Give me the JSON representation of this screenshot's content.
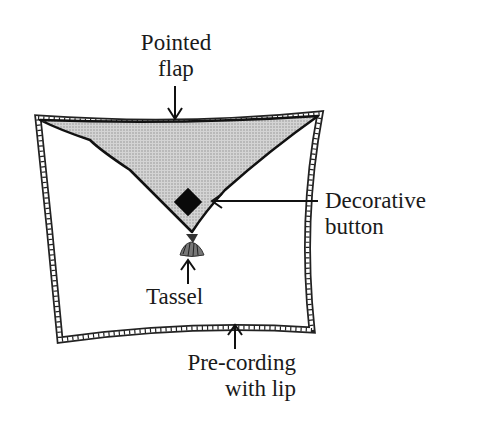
{
  "diagram": {
    "labels": {
      "pointed_flap": [
        "Pointed",
        "flap"
      ],
      "decorative_button": [
        "Decorative",
        "button"
      ],
      "tassel": [
        "Tassel"
      ],
      "pre_cording": [
        "Pre-cording",
        "with lip"
      ]
    },
    "colors": {
      "outline": "#111111",
      "flap_fill": "#c8c8c8",
      "background": "#ffffff"
    }
  }
}
